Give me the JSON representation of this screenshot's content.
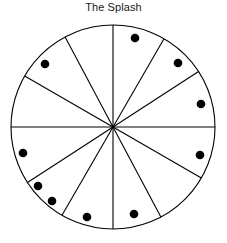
{
  "figure": {
    "title": "The Splash",
    "background_color": "#ffffff",
    "stroke_color": "#000000",
    "dot_color": "#000000"
  },
  "chart_data": {
    "type": "scatter",
    "title": "The Splash",
    "subtitle": "",
    "xlabel": "",
    "ylabel": "",
    "grid": false,
    "legend": null,
    "circle": {
      "center_x": 113,
      "center_y": 127,
      "radius": 102,
      "stroke_width": 1.1
    },
    "sector_count": 12,
    "diameter_count": 6,
    "diameter_angles_deg": [
      90,
      60,
      33,
      0,
      150,
      118
    ],
    "spoke_angles_deg": [
      90,
      60,
      33,
      0,
      330,
      298,
      270,
      240,
      213,
      180,
      150,
      118
    ],
    "dots": [
      {
        "id": "dot-1",
        "cx": 135,
        "cy": 38,
        "r": 4.3
      },
      {
        "id": "dot-2",
        "cx": 178,
        "cy": 63,
        "r": 4.3
      },
      {
        "id": "dot-3",
        "cx": 201,
        "cy": 104,
        "r": 4.3
      },
      {
        "id": "dot-4",
        "cx": 200,
        "cy": 155,
        "r": 4.3
      },
      {
        "id": "dot-5",
        "cx": 134,
        "cy": 214,
        "r": 4.3
      },
      {
        "id": "dot-6",
        "cx": 87,
        "cy": 217,
        "r": 4.3
      },
      {
        "id": "dot-7",
        "cx": 52,
        "cy": 201,
        "r": 4.3
      },
      {
        "id": "dot-8",
        "cx": 38,
        "cy": 186,
        "r": 4.3
      },
      {
        "id": "dot-9",
        "cx": 23,
        "cy": 153,
        "r": 4.3
      },
      {
        "id": "dot-10",
        "cx": 45,
        "cy": 64,
        "r": 4.3
      },
      {
        "id": "dot-11",
        "cx": 135,
        "cy": 38,
        "r": 0
      }
    ],
    "dot_count": 11,
    "xlim": [
      0,
      227
    ],
    "ylim": [
      0,
      243
    ]
  }
}
